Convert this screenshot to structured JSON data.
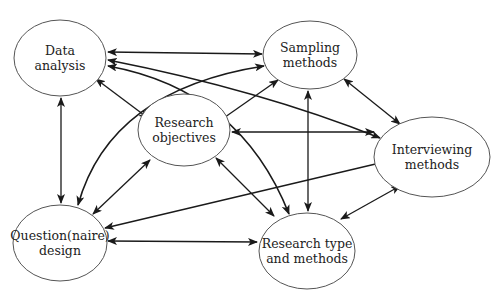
{
  "diagram": {
    "type": "concept-network",
    "nodes": [
      {
        "id": "data_analysis",
        "line1": "Data",
        "line2": "analysis",
        "cx": 60,
        "cy": 58,
        "rx": 46,
        "ry": 38
      },
      {
        "id": "sampling",
        "line1": "Sampling",
        "line2": "methods",
        "cx": 310,
        "cy": 55,
        "rx": 47,
        "ry": 34
      },
      {
        "id": "objectives",
        "line1": "Research",
        "line2": "objectives",
        "cx": 184,
        "cy": 130,
        "rx": 46,
        "ry": 36
      },
      {
        "id": "interviewing",
        "line1": "Interviewing",
        "line2": "methods",
        "cx": 432,
        "cy": 157,
        "rx": 58,
        "ry": 40
      },
      {
        "id": "questionnaire",
        "line1": "Question(naire)",
        "line2": "design",
        "cx": 60,
        "cy": 243,
        "rx": 47,
        "ry": 38
      },
      {
        "id": "research_type",
        "line1": "Research type",
        "line2": "and methods",
        "cx": 307,
        "cy": 251,
        "rx": 48,
        "ry": 38
      }
    ],
    "edges": [
      {
        "from": "data_analysis",
        "to": "sampling",
        "direction": "both"
      },
      {
        "from": "data_analysis",
        "to": "interviewing",
        "direction": "both"
      },
      {
        "from": "data_analysis",
        "to": "research_type",
        "direction": "both"
      },
      {
        "from": "data_analysis",
        "to": "objectives",
        "direction": "both"
      },
      {
        "from": "data_analysis",
        "to": "questionnaire",
        "direction": "both"
      },
      {
        "from": "questionnaire",
        "to": "sampling",
        "direction": "both"
      },
      {
        "from": "sampling",
        "to": "objectives",
        "direction": "both"
      },
      {
        "from": "sampling",
        "to": "interviewing",
        "direction": "both"
      },
      {
        "from": "sampling",
        "to": "research_type",
        "direction": "both"
      },
      {
        "from": "objectives",
        "to": "interviewing",
        "direction": "both"
      },
      {
        "from": "objectives",
        "to": "questionnaire",
        "direction": "both"
      },
      {
        "from": "objectives",
        "to": "research_type",
        "direction": "both"
      },
      {
        "from": "interviewing",
        "to": "questionnaire",
        "direction": "both"
      },
      {
        "from": "interviewing",
        "to": "research_type",
        "direction": "both"
      },
      {
        "from": "questionnaire",
        "to": "research_type",
        "direction": "both"
      }
    ]
  }
}
